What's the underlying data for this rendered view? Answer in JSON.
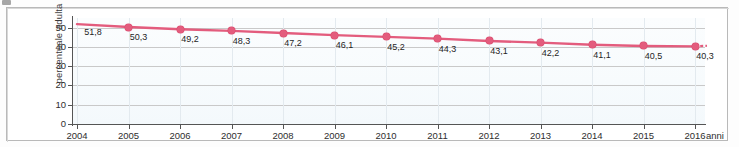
{
  "chart_data": {
    "type": "line",
    "title": "",
    "subtitle": "",
    "xlabel": "anni",
    "ylabel": "percentuale adulta",
    "x": [
      2004,
      2005,
      2006,
      2007,
      2008,
      2009,
      2010,
      2011,
      2012,
      2013,
      2014,
      2015,
      2016
    ],
    "categories": [
      "2004",
      "2005",
      "2006",
      "2007",
      "2008",
      "2009",
      "2010",
      "2011",
      "2012",
      "2013",
      "2014",
      "2015",
      "2016"
    ],
    "values": [
      51.8,
      50.3,
      49.2,
      48.3,
      47.2,
      46.1,
      45.2,
      44.3,
      43.1,
      42.2,
      41.1,
      40.5,
      40.3
    ],
    "point_labels": [
      "51,8",
      "50,3",
      "49,2",
      "48,3",
      "47,2",
      "46,1",
      "45,2",
      "44,3",
      "43,1",
      "42,2",
      "41,1",
      "40,5",
      "40,3"
    ],
    "ylim": [
      0,
      55
    ],
    "xlim": [
      2004,
      2016
    ],
    "yticks": [
      0,
      10,
      20,
      30,
      40,
      50
    ],
    "ytick_labels": [
      "0",
      "10",
      "20",
      "30",
      "40",
      "50"
    ],
    "xtick_labels": [
      "2004",
      "2005",
      "2006",
      "2007",
      "2008",
      "2009",
      "2010",
      "2011",
      "2012",
      "2013",
      "2014",
      "2015",
      "2016"
    ],
    "grid": true,
    "legend": null,
    "legend_position": "none",
    "series": [
      {
        "name": "percentuale adulta",
        "values": [
          51.8,
          50.3,
          49.2,
          48.3,
          47.2,
          46.1,
          45.2,
          44.3,
          43.1,
          42.2,
          41.1,
          40.5,
          40.3
        ],
        "color": "#e35c7d",
        "marker": "circle",
        "has_projection": true,
        "projection_style": "dashed"
      }
    ],
    "annotations": []
  },
  "colors": {
    "series_line": "#e35c7d",
    "marker_fill": "#e35c7d",
    "grid": "#c9c9c9",
    "axis": "#555555",
    "plot_background": "#f7fbfd",
    "frame_border": "#b9b9b9",
    "text": "#2e2e2e"
  }
}
